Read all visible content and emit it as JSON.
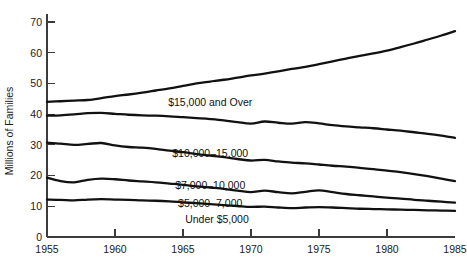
{
  "chart_data": {
    "type": "line",
    "title": "",
    "xlabel": "",
    "ylabel": "Millions of Families",
    "xlim": [
      1955,
      1985
    ],
    "ylim": [
      0,
      73
    ],
    "grid": false,
    "legend_position": "inline-annotations",
    "xticks": [
      1955,
      1960,
      1965,
      1970,
      1975,
      1980,
      1985
    ],
    "xtick_labels": [
      "1955",
      "1960",
      "1965",
      "1970",
      "1975",
      "1980",
      "1985"
    ],
    "yticks": [
      0,
      10,
      20,
      30,
      40,
      50,
      60,
      70
    ],
    "ytick_labels": [
      "0",
      "10",
      "20",
      "30",
      "40",
      "50",
      "60",
      "70"
    ],
    "x": [
      1955,
      1956,
      1957,
      1958,
      1959,
      1960,
      1961,
      1962,
      1963,
      1964,
      1965,
      1966,
      1967,
      1968,
      1969,
      1970,
      1971,
      1972,
      1973,
      1974,
      1975,
      1976,
      1977,
      1978,
      1979,
      1980,
      1981,
      1982,
      1983,
      1984,
      1985
    ],
    "series": [
      {
        "name": "$15,000 and Over",
        "label": "$15,000 and Over",
        "label_x": 1967.0,
        "label_y": 42.5,
        "color": "#111111",
        "values": [
          44.0,
          44.2,
          44.4,
          44.6,
          45.2,
          45.9,
          46.4,
          47.0,
          47.7,
          48.4,
          49.2,
          50.0,
          50.6,
          51.2,
          51.9,
          52.6,
          53.2,
          53.9,
          54.7,
          55.4,
          56.3,
          57.2,
          58.1,
          59.0,
          59.8,
          60.7,
          61.8,
          63.0,
          64.3,
          65.6,
          67.0
        ]
      },
      {
        "name": "$10,000-15,000",
        "label": "$10,000–15,000",
        "label_x": 1967.0,
        "label_y": 26.2,
        "color": "#111111",
        "values": [
          39.5,
          39.6,
          39.9,
          40.3,
          40.4,
          40.1,
          39.8,
          39.6,
          39.5,
          39.3,
          39.0,
          38.7,
          38.4,
          38.0,
          37.4,
          36.9,
          37.6,
          37.2,
          36.9,
          37.4,
          37.0,
          36.4,
          36.0,
          35.7,
          35.4,
          35.0,
          34.6,
          34.1,
          33.6,
          33.0,
          32.3
        ]
      },
      {
        "name": "$7,000-10,000",
        "label": "$7,000–10,000",
        "label_x": 1967.0,
        "label_y": 15.5,
        "color": "#111111",
        "values": [
          30.7,
          30.4,
          30.0,
          30.3,
          30.6,
          29.8,
          29.3,
          29.1,
          28.7,
          28.1,
          27.6,
          27.0,
          26.5,
          26.0,
          25.4,
          24.9,
          25.1,
          24.6,
          24.2,
          24.0,
          23.6,
          23.2,
          22.9,
          22.5,
          22.1,
          21.6,
          21.1,
          20.5,
          19.8,
          19.0,
          18.2
        ]
      },
      {
        "name": "$5,000-7,000",
        "label": "$5,000–7,000",
        "label_x": 1967.0,
        "label_y": 9.8,
        "color": "#111111",
        "values": [
          19.3,
          18.2,
          17.8,
          18.6,
          19.0,
          18.8,
          18.4,
          18.1,
          17.8,
          17.4,
          17.0,
          16.5,
          16.1,
          15.7,
          15.1,
          14.6,
          15.1,
          14.6,
          14.2,
          14.7,
          15.2,
          14.6,
          14.0,
          13.6,
          13.2,
          12.8,
          12.5,
          12.1,
          11.8,
          11.5,
          11.2
        ]
      },
      {
        "name": "Under $5,000",
        "label": "Under $5,000",
        "label_x": 1967.5,
        "label_y": 4.4,
        "color": "#111111",
        "values": [
          12.2,
          12.1,
          11.9,
          12.2,
          12.3,
          12.2,
          12.1,
          11.9,
          11.8,
          11.6,
          11.3,
          11.0,
          10.7,
          10.4,
          10.1,
          9.8,
          9.9,
          9.6,
          9.4,
          9.6,
          9.7,
          9.6,
          9.4,
          9.2,
          9.1,
          9.0,
          8.9,
          8.8,
          8.7,
          8.6,
          8.5
        ]
      }
    ]
  }
}
